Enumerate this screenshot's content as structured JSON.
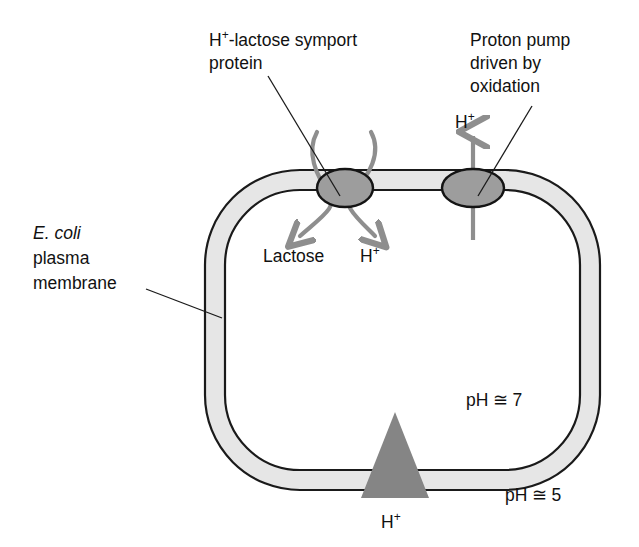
{
  "figure": {
    "background_color": "#ffffff"
  },
  "labels": {
    "symport": {
      "line1_main": "H",
      "line1_sup": "+",
      "line1_rest": "-lactose symport",
      "line2": "protein"
    },
    "pump": {
      "line1": "Proton pump",
      "line2": "driven by",
      "line3": "oxidation"
    },
    "membrane": {
      "line1": "E. coli",
      "line2": "plasma",
      "line3": "membrane"
    },
    "inner": {
      "lactose": "Lactose",
      "proton_main": "H",
      "proton_sup": "+"
    },
    "pump_arrow": {
      "main": "H",
      "sup": "+"
    },
    "gradient_arrow": {
      "main": "H",
      "sup": "+"
    },
    "ph_inside": {
      "prefix": "pH",
      "symbol": "≅",
      "value": "7"
    },
    "ph_outside": {
      "prefix": "pH",
      "symbol": "≅",
      "value": "5"
    }
  },
  "colors": {
    "membrane_fill": "#e6e6e6",
    "membrane_stroke": "#1a1a1a",
    "protein_fill": "#9d9d9d",
    "arrow_gray": "#8e8e8e",
    "triangle_gray": "#858585",
    "text": "#111111"
  },
  "geometry": {
    "cell_left": 205,
    "cell_right": 600,
    "cell_top": 170,
    "cell_bottom": 490,
    "membrane_thickness": 20,
    "corner_radius": 95
  }
}
